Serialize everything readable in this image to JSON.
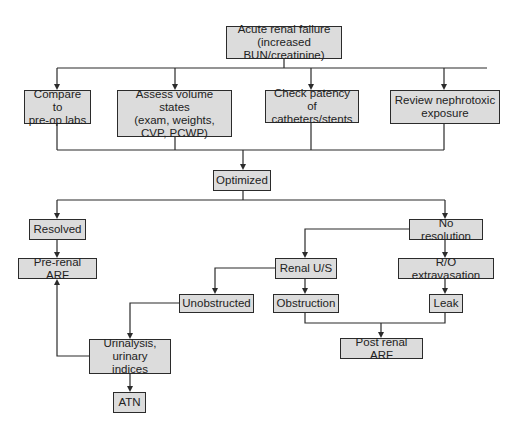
{
  "diagram": {
    "type": "flowchart",
    "nodes": {
      "arf": {
        "label": "Acute renal failure\n(increased BUN/creatinine)"
      },
      "compare": {
        "label": "Compare to\npre-op labs"
      },
      "assess": {
        "label": "Assess volume states\n(exam, weights,\nCVP, PCWP)"
      },
      "patency": {
        "label": "Check patency of\ncatheters/stents"
      },
      "nephrotoxic": {
        "label": "Review nephrotoxic\nexposure"
      },
      "optimized": {
        "label": "Optimized"
      },
      "resolved": {
        "label": "Resolved"
      },
      "prerenal": {
        "label": "Pre-renal ARF"
      },
      "noresolution": {
        "label": "No resolution"
      },
      "renalus": {
        "label": "Renal U/S"
      },
      "extravasation": {
        "label": "R/O extravasation"
      },
      "unobstructed": {
        "label": "Unobstructed"
      },
      "obstruction": {
        "label": "Obstruction"
      },
      "leak": {
        "label": "Leak"
      },
      "urinalysis": {
        "label": "Urinalysis,\nurinary indices"
      },
      "postrenal": {
        "label": "Post renal ARF"
      },
      "atn": {
        "label": "ATN"
      }
    },
    "edges": [
      {
        "from": "arf",
        "to": "compare"
      },
      {
        "from": "arf",
        "to": "assess"
      },
      {
        "from": "arf",
        "to": "patency"
      },
      {
        "from": "arf",
        "to": "nephrotoxic"
      },
      {
        "from": "compare",
        "to": "optimized"
      },
      {
        "from": "assess",
        "to": "optimized"
      },
      {
        "from": "patency",
        "to": "optimized"
      },
      {
        "from": "nephrotoxic",
        "to": "optimized"
      },
      {
        "from": "optimized",
        "to": "resolved"
      },
      {
        "from": "optimized",
        "to": "noresolution"
      },
      {
        "from": "resolved",
        "to": "prerenal"
      },
      {
        "from": "noresolution",
        "to": "renalus"
      },
      {
        "from": "noresolution",
        "to": "extravasation"
      },
      {
        "from": "renalus",
        "to": "unobstructed"
      },
      {
        "from": "renalus",
        "to": "obstruction"
      },
      {
        "from": "extravasation",
        "to": "leak"
      },
      {
        "from": "unobstructed",
        "to": "urinalysis"
      },
      {
        "from": "urinalysis",
        "to": "prerenal"
      },
      {
        "from": "urinalysis",
        "to": "atn"
      },
      {
        "from": "obstruction",
        "to": "postrenal"
      },
      {
        "from": "leak",
        "to": "postrenal"
      }
    ]
  }
}
